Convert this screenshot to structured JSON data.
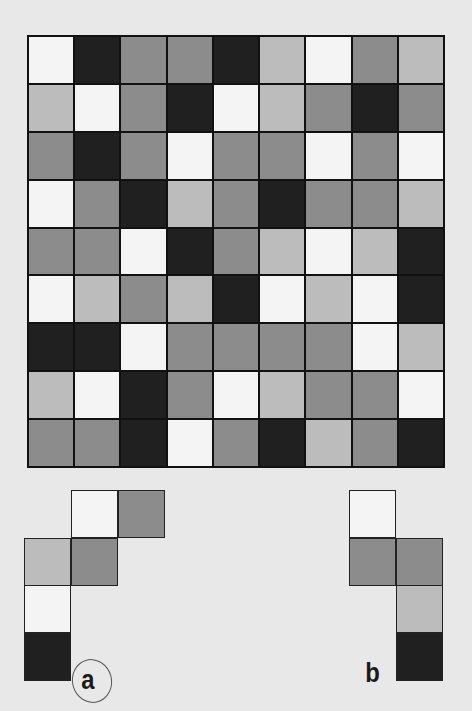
{
  "colors": {
    "W": "#f4f4f4",
    "L": "#bcbcbc",
    "M": "#8c8c8c",
    "D": "#202020",
    "background": "#e8e8e8"
  },
  "grid": {
    "rows": 9,
    "cols": 9,
    "cells": [
      [
        "W",
        "D",
        "M",
        "M",
        "D",
        "L",
        "W",
        "M",
        "L"
      ],
      [
        "L",
        "W",
        "M",
        "D",
        "W",
        "L",
        "M",
        "D",
        "M"
      ],
      [
        "M",
        "D",
        "M",
        "W",
        "M",
        "M",
        "W",
        "M",
        "W"
      ],
      [
        "W",
        "M",
        "D",
        "L",
        "M",
        "D",
        "M",
        "M",
        "L"
      ],
      [
        "M",
        "M",
        "W",
        "D",
        "M",
        "L",
        "W",
        "L",
        "D"
      ],
      [
        "W",
        "L",
        "M",
        "L",
        "D",
        "W",
        "L",
        "W",
        "D"
      ],
      [
        "D",
        "D",
        "W",
        "M",
        "M",
        "M",
        "M",
        "W",
        "L"
      ],
      [
        "L",
        "W",
        "D",
        "M",
        "W",
        "L",
        "M",
        "M",
        "W"
      ],
      [
        "M",
        "M",
        "D",
        "W",
        "M",
        "D",
        "L",
        "M",
        "D"
      ]
    ]
  },
  "pieces": [
    {
      "label": "a",
      "circled": true,
      "cells": [
        {
          "row": 0,
          "col": 1,
          "shade": "W"
        },
        {
          "row": 0,
          "col": 2,
          "shade": "M"
        },
        {
          "row": 1,
          "col": 0,
          "shade": "L"
        },
        {
          "row": 1,
          "col": 1,
          "shade": "M"
        },
        {
          "row": 2,
          "col": 0,
          "shade": "W"
        },
        {
          "row": 3,
          "col": 0,
          "shade": "D"
        }
      ]
    },
    {
      "label": "b",
      "circled": false,
      "cells": [
        {
          "row": 0,
          "col": 0,
          "shade": "W"
        },
        {
          "row": 1,
          "col": 0,
          "shade": "M"
        },
        {
          "row": 1,
          "col": 1,
          "shade": "M"
        },
        {
          "row": 2,
          "col": 1,
          "shade": "L"
        },
        {
          "row": 3,
          "col": 1,
          "shade": "D"
        }
      ]
    }
  ]
}
